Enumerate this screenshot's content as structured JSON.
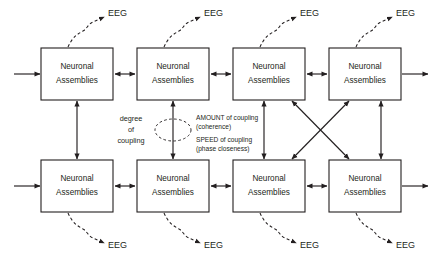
{
  "diagram": {
    "background_color": "#ffffff",
    "line_color": "#231f20",
    "box_label_line1": "Neuronal",
    "box_label_line2": "Assemblies",
    "boxes": [
      {
        "id": "top-1",
        "row": "top",
        "column": 1,
        "line1": "Neuronal",
        "line2": "Assemblies"
      },
      {
        "id": "top-2",
        "row": "top",
        "column": 2,
        "line1": "Neuronal",
        "line2": "Assemblies"
      },
      {
        "id": "top-3",
        "row": "top",
        "column": 3,
        "line1": "Neuronal",
        "line2": "Assemblies"
      },
      {
        "id": "top-4",
        "row": "top",
        "column": 4,
        "line1": "Neuronal",
        "line2": "Assemblies"
      },
      {
        "id": "bottom-1",
        "row": "bottom",
        "column": 1,
        "line1": "Neuronal",
        "line2": "Assemblies"
      },
      {
        "id": "bottom-2",
        "row": "bottom",
        "column": 2,
        "line1": "Neuronal",
        "line2": "Assemblies"
      },
      {
        "id": "bottom-3",
        "row": "bottom",
        "column": 3,
        "line1": "Neuronal",
        "line2": "Assemblies"
      },
      {
        "id": "bottom-4",
        "row": "bottom",
        "column": 4,
        "line1": "Neuronal",
        "line2": "Assemblies"
      }
    ],
    "eeg_labels": [
      {
        "id": "eeg-top-1",
        "text": "EEG",
        "row": "top",
        "column": 1
      },
      {
        "id": "eeg-top-2",
        "text": "EEG",
        "row": "top",
        "column": 2
      },
      {
        "id": "eeg-top-3",
        "text": "EEG",
        "row": "top",
        "column": 3
      },
      {
        "id": "eeg-top-4",
        "text": "EEG",
        "row": "top",
        "column": 4
      },
      {
        "id": "eeg-bottom-1",
        "text": "EEG",
        "row": "bottom",
        "column": 1
      },
      {
        "id": "eeg-bottom-2",
        "text": "EEG",
        "row": "bottom",
        "column": 2
      },
      {
        "id": "eeg-bottom-3",
        "text": "EEG",
        "row": "bottom",
        "column": 3
      },
      {
        "id": "eeg-bottom-4",
        "text": "EEG",
        "row": "bottom",
        "column": 4
      }
    ],
    "annotations": {
      "degree_line1": "degree",
      "degree_line2": "of",
      "degree_line3": "coupling",
      "amount_line1": "AMOUNT of coupling",
      "amount_line2": "(coherence)",
      "speed_line1": "SPEED of coupling",
      "speed_line2": "(phase closeness)"
    }
  }
}
